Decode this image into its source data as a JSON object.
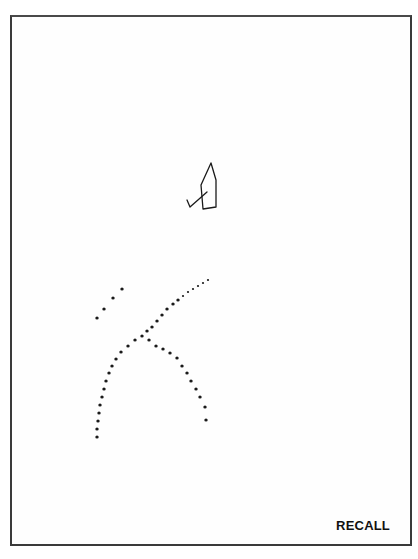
{
  "page": {
    "label": "RECALL",
    "stroke_color": "#1a1a1a",
    "border_color": "#3a3a3a"
  },
  "drawing": {
    "name": "sketch-figure",
    "outline": [
      [
        211,
        163
      ],
      [
        216,
        180
      ],
      [
        216,
        207
      ],
      [
        203,
        209
      ],
      [
        201,
        185
      ],
      [
        211,
        163
      ]
    ],
    "hook": [
      [
        207,
        192
      ],
      [
        190,
        207
      ],
      [
        187,
        200
      ]
    ]
  },
  "dot_trails": {
    "upper_left_short": [
      [
        97,
        318
      ],
      [
        104,
        309
      ],
      [
        113,
        298
      ],
      [
        122,
        289
      ]
    ],
    "upper_right_diagonal": [
      [
        208,
        280
      ],
      [
        203,
        283
      ],
      [
        198,
        286
      ],
      [
        193,
        289
      ],
      [
        188,
        292
      ],
      [
        183,
        296
      ],
      [
        178,
        300
      ],
      [
        173,
        304
      ],
      [
        167,
        309
      ],
      [
        162,
        315
      ],
      [
        157,
        321
      ],
      [
        152,
        327
      ],
      [
        147,
        331
      ]
    ],
    "left_arc": [
      [
        142,
        336
      ],
      [
        135,
        340
      ],
      [
        128,
        346
      ],
      [
        121,
        352
      ],
      [
        116,
        359
      ],
      [
        112,
        366
      ],
      [
        109,
        373
      ],
      [
        106,
        381
      ],
      [
        104,
        389
      ],
      [
        102,
        397
      ],
      [
        100,
        405
      ],
      [
        99,
        413
      ],
      [
        98,
        421
      ],
      [
        97,
        429
      ],
      [
        97,
        437
      ]
    ],
    "right_descending": [
      [
        149,
        340
      ],
      [
        156,
        346
      ],
      [
        163,
        349
      ],
      [
        170,
        353
      ],
      [
        177,
        358
      ],
      [
        182,
        366
      ],
      [
        187,
        373
      ],
      [
        191,
        381
      ],
      [
        196,
        389
      ],
      [
        200,
        397
      ],
      [
        205,
        407
      ],
      [
        206,
        420
      ]
    ]
  }
}
